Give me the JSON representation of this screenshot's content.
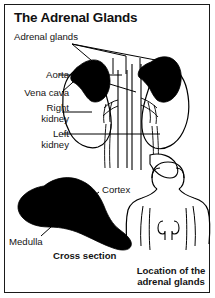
{
  "figure": {
    "title": "The Adrenal Glands",
    "border_color": "#1a1a1a",
    "ink_color": "#000000",
    "background": "#ffffff"
  },
  "panels": {
    "main": {
      "name": "kidneys-and-adrenal-glands-diagram",
      "labels": {
        "adrenal_glands": "Adrenal glands",
        "aorta": "Aorta",
        "vena_cava": "Vena cava",
        "right_kidney": "Right\nkidney",
        "right_kidney_line1": "Right",
        "right_kidney_line2": "kidney",
        "left_kidney_line1": "Left",
        "left_kidney_line2": "kidney"
      }
    },
    "cross_section": {
      "name": "adrenal-gland-cross-section",
      "caption": "Cross section",
      "labels": {
        "cortex": "Cortex",
        "medulla": "Medulla"
      }
    },
    "location": {
      "name": "body-location-figure",
      "caption_line1": "Location of the",
      "caption_line2": "adrenal glands"
    }
  }
}
